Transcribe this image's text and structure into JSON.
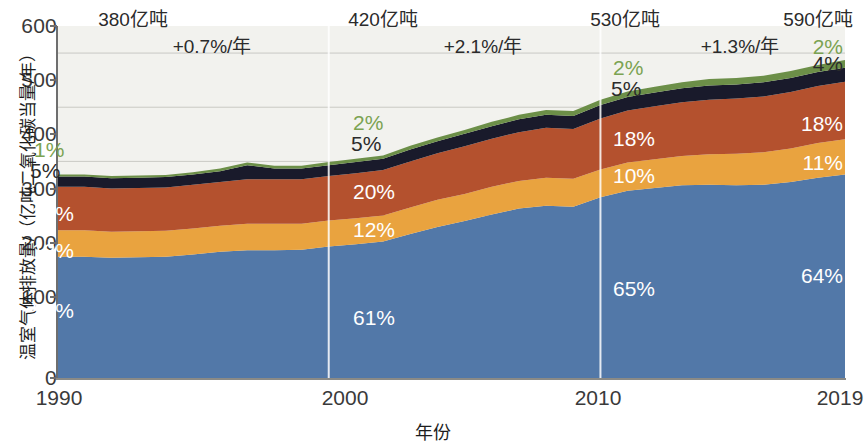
{
  "chart_data": {
    "type": "area",
    "stacked": true,
    "title": "",
    "xlabel": "年份",
    "ylabel": "温室气体排放量/（亿吨二氧化碳当量/年）",
    "xlim": [
      1990,
      2019
    ],
    "ylim": [
      0,
      650
    ],
    "yticks": [
      0,
      100,
      200,
      300,
      400,
      500,
      600
    ],
    "xticks": [
      1990,
      2000,
      2010,
      2019
    ],
    "grid": "horizontal",
    "legend": "none",
    "x": [
      1990,
      1991,
      1992,
      1993,
      1994,
      1995,
      1996,
      1997,
      1998,
      1999,
      2000,
      2001,
      2002,
      2003,
      2004,
      2005,
      2006,
      2007,
      2008,
      2009,
      2010,
      2011,
      2012,
      2013,
      2014,
      2015,
      2016,
      2017,
      2018,
      2019
    ],
    "series": [
      {
        "name": "CO2 化石燃料和工业",
        "color": "#5278a8",
        "share_labels": {
          "1990": "59%",
          "2000": "61%",
          "2010": "65%",
          "2019": "64%"
        },
        "values": [
          224,
          224,
          222,
          223,
          224,
          228,
          233,
          236,
          236,
          237,
          243,
          247,
          252,
          266,
          279,
          290,
          302,
          313,
          318,
          316,
          334,
          346,
          351,
          356,
          357,
          356,
          357,
          362,
          370,
          376
        ]
      },
      {
        "name": "CO2 土地利用变化",
        "color": "#e9a33f",
        "share_labels": {
          "1990": "13%",
          "2000": "12%",
          "2010": "10%",
          "2019": "11%"
        },
        "values": [
          49,
          49,
          48,
          48,
          48,
          48,
          48,
          49,
          49,
          48,
          48,
          48,
          48,
          49,
          50,
          50,
          51,
          51,
          52,
          52,
          51,
          52,
          53,
          54,
          56,
          58,
          60,
          62,
          64,
          65
        ]
      },
      {
        "name": "甲烷 CH4",
        "color": "#b4512e",
        "share_labels": {
          "1990": "21%",
          "2000": "20%",
          "2010": "18%",
          "2019": "18%"
        },
        "values": [
          80,
          80,
          80,
          80,
          80,
          81,
          81,
          82,
          82,
          82,
          82,
          83,
          84,
          85,
          86,
          88,
          89,
          90,
          92,
          92,
          94,
          96,
          98,
          99,
          101,
          102,
          103,
          104,
          105,
          106
        ]
      },
      {
        "name": "氧化亚氮 N2O",
        "color": "#191a2b",
        "share_labels": {
          "1990": "5%",
          "2000": "5%",
          "2010": "5%",
          "2019": "4%"
        },
        "values": [
          19,
          19,
          19,
          19,
          19,
          19,
          20,
          26,
          20,
          20,
          20,
          21,
          21,
          22,
          22,
          23,
          23,
          24,
          24,
          24,
          25,
          25,
          25,
          26,
          26,
          26,
          26,
          26,
          26,
          26
        ]
      },
      {
        "name": "含氟气体 F-gases",
        "color": "#6c8f48",
        "share_labels": {
          "1990": "1%",
          "2000": "2%",
          "2010": "2%",
          "2019": "2%"
        },
        "values": [
          4,
          4,
          4,
          4,
          4,
          4,
          5,
          5,
          5,
          5,
          6,
          6,
          6,
          7,
          7,
          7,
          8,
          8,
          9,
          9,
          10,
          10,
          11,
          11,
          12,
          12,
          12,
          13,
          13,
          14
        ]
      }
    ],
    "period_totals": [
      {
        "year": 1990,
        "label": "380亿吨"
      },
      {
        "year": 2000,
        "label": "420亿吨"
      },
      {
        "year": 2010,
        "label": "530亿吨"
      },
      {
        "year": 2019,
        "label": "590亿吨"
      }
    ],
    "growth_rates": [
      {
        "from": 1990,
        "to": 2000,
        "label": "+0.7%/年"
      },
      {
        "from": 2000,
        "to": 2010,
        "label": "+2.1%/年"
      },
      {
        "from": 2010,
        "to": 2019,
        "label": "+1.3%/年"
      }
    ],
    "dividers": [
      2000,
      2010
    ]
  },
  "axis": {
    "y_title": "温室气体排放量/（亿吨二氧化碳当量/年）",
    "x_title": "年份",
    "y_ticks": [
      "600",
      "500",
      "400",
      "300",
      "200",
      "100",
      "0"
    ],
    "x_ticks": [
      "1990",
      "2000",
      "2010",
      "2019"
    ]
  },
  "annotations": {
    "totals": [
      "380亿吨",
      "420亿吨",
      "530亿吨",
      "590亿吨"
    ],
    "rates": [
      "+0.7%/年",
      "+2.1%/年",
      "+1.3%/年"
    ],
    "percents_1990": {
      "fgas": "1%",
      "n2o": "5%",
      "ch4": "21%",
      "luc": "13%",
      "co2": "59%"
    },
    "percents_2000": {
      "fgas": "2%",
      "n2o": "5%",
      "ch4": "20%",
      "luc": "12%",
      "co2": "61%"
    },
    "percents_2010": {
      "fgas": "2%",
      "n2o": "5%",
      "ch4": "18%",
      "luc": "10%",
      "co2": "65%"
    },
    "percents_2019": {
      "fgas": "2%",
      "n2o": "4%",
      "ch4": "18%",
      "luc": "11%",
      "co2": "64%"
    }
  },
  "colors": {
    "co2_fossil": "#5278a8",
    "co2_landuse": "#e9a33f",
    "methane": "#b4512e",
    "nitrous_oxide": "#191a2b",
    "fgases": "#6c8f48",
    "plot_background": "#f2f2ee",
    "gridline": "#c9c9c4",
    "divider": "#ffffff"
  }
}
